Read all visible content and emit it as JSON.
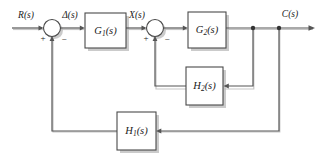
{
  "diagram": {
    "type": "control-system-block-diagram",
    "background_color": "#ffffff",
    "line_color": "#555555",
    "block_stroke_color": "#4a4a4a",
    "text_color": "#1a1a1a",
    "shadow_color": "#b9b9b9"
  },
  "signals": {
    "input": "R(s)",
    "error": "Δ(s)",
    "intermediate": "X(s)",
    "output": "C(s)"
  },
  "blocks": [
    {
      "id": "G1",
      "base": "G",
      "sub": "1",
      "suffix": "(s)",
      "label": "G₁(s)",
      "x": 85,
      "y": 13,
      "w": 41,
      "h": 35
    },
    {
      "id": "G2",
      "base": "G",
      "sub": "2",
      "suffix": "(s)",
      "label": "G₂(s)",
      "x": 188,
      "y": 12,
      "w": 38,
      "h": 36
    },
    {
      "id": "H2",
      "base": "H",
      "sub": "2",
      "suffix": "(s)",
      "label": "H₂(s)",
      "x": 186,
      "y": 67,
      "w": 37,
      "h": 38
    },
    {
      "id": "H1",
      "base": "H",
      "sub": "1",
      "suffix": "(s)",
      "label": "H₁(s)",
      "x": 117,
      "y": 112,
      "w": 39,
      "h": 38
    }
  ],
  "summing_junctions": [
    {
      "id": "sum1",
      "cx": 52,
      "cy": 28,
      "r": 8.5,
      "signs": [
        {
          "value": "+",
          "position": "left-below",
          "x": 43,
          "y": 38
        },
        {
          "value": "−",
          "position": "right-below",
          "x": 63,
          "y": 39
        }
      ]
    },
    {
      "id": "sum2",
      "cx": 155,
      "cy": 28,
      "r": 8.5,
      "signs": [
        {
          "value": "+",
          "position": "left-below",
          "x": 146,
          "y": 38
        },
        {
          "value": "−",
          "position": "right-below",
          "x": 166,
          "y": 39
        }
      ]
    }
  ],
  "nodes": [
    {
      "id": "branch-h2",
      "x": 253,
      "y": 28,
      "feeds": "H2"
    },
    {
      "id": "branch-h1",
      "x": 279,
      "y": 28,
      "feeds": "H1"
    }
  ],
  "signal_label_positions": {
    "input": {
      "x": 26,
      "y": 16
    },
    "error": {
      "x": 70,
      "y": 16
    },
    "intermediate": {
      "x": 137,
      "y": 16
    },
    "output": {
      "x": 290,
      "y": 15
    }
  },
  "paths": {
    "forward": "R(s) → sum1 → Δ(s) → G1(s) → X(s) → sum2 → G2(s) → C(s)",
    "inner_feedback": "branch-h2 → H2(s) → sum2 (negative)",
    "outer_feedback": "branch-h1 → H1(s) → sum1 (negative)"
  }
}
